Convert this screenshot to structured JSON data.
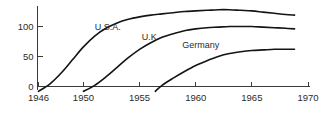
{
  "chart_data": {
    "type": "line",
    "title": "",
    "subtitle": "",
    "xlabel": "",
    "ylabel": "",
    "xlim": [
      1945.2,
      1970.6
    ],
    "ylim": [
      -12,
      140
    ],
    "grid": false,
    "legend_position": "inline-labels",
    "xticks": [
      1946,
      1950,
      1955,
      1960,
      1965,
      1970
    ],
    "xticklabels": [
      "1946",
      "1950",
      "1955",
      "1960",
      "1965",
      "1970"
    ],
    "yticks": [
      0,
      50,
      100
    ],
    "yticklabels": [
      "0",
      "50",
      "100"
    ],
    "series": [
      {
        "name": "U.S.A.",
        "label_x": 1951.0,
        "label_y": 95,
        "x": [
          1946.0,
          1947.0,
          1948.0,
          1949.0,
          1950.0,
          1951.0,
          1952.0,
          1953.0,
          1954.0,
          1955.0,
          1956.0,
          1957.0,
          1958.0,
          1959.0,
          1960.0,
          1961.0,
          1962.0,
          1963.0,
          1964.0,
          1965.0,
          1966.0,
          1967.0,
          1968.0,
          1968.8
        ],
        "y": [
          -8,
          4,
          22,
          44,
          66,
          84,
          97,
          106,
          112,
          116,
          119,
          121,
          123,
          125,
          126,
          127,
          128,
          128,
          127,
          126,
          124,
          122,
          120,
          119
        ]
      },
      {
        "name": "U.K.",
        "label_x": 1955.2,
        "label_y": 78,
        "x": [
          1950.0,
          1951.0,
          1952.0,
          1953.0,
          1954.0,
          1955.0,
          1956.0,
          1957.0,
          1958.0,
          1959.0,
          1960.0,
          1961.0,
          1962.0,
          1963.0,
          1964.0,
          1965.0,
          1966.0,
          1967.0,
          1968.0,
          1968.8
        ],
        "y": [
          -8,
          2,
          16,
          32,
          48,
          62,
          73,
          82,
          88,
          93,
          96,
          98,
          99,
          100,
          100,
          100,
          99,
          98,
          97,
          96
        ]
      },
      {
        "name": "Germany",
        "label_x": 1958.8,
        "label_y": 64,
        "x": [
          1956.4,
          1957.0,
          1958.0,
          1959.0,
          1960.0,
          1961.0,
          1962.0,
          1963.0,
          1964.0,
          1965.0,
          1966.0,
          1967.0,
          1968.0,
          1968.8
        ],
        "y": [
          -8,
          2,
          14,
          25,
          35,
          43,
          50,
          55,
          58,
          60,
          61,
          62,
          62,
          62
        ]
      }
    ]
  },
  "colors": {
    "line": "#141414",
    "axis": "#3a3a3a",
    "text": "#2b2b2b",
    "background": "#ffffff"
  }
}
